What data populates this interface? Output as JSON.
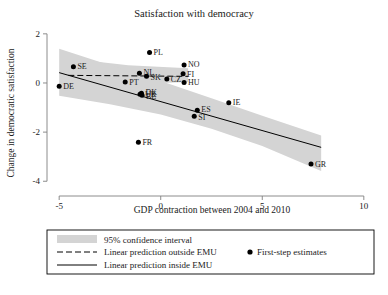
{
  "chart_data": {
    "type": "scatter",
    "title": "Satisfaction with democracy",
    "xlabel": "GDP contraction between 2004 and 2010",
    "ylabel": "Change in democratic satisfaction",
    "xlim": [
      -5.6,
      10.6
    ],
    "ylim": [
      -4.6,
      2.4
    ],
    "xticks": [
      -5,
      0,
      5,
      10
    ],
    "xtick_labels": [
      "-5",
      "0",
      "5",
      "10"
    ],
    "yticks": [
      2,
      0,
      -2,
      -4
    ],
    "ytick_labels": [
      "2",
      "0",
      "-2",
      "-4"
    ],
    "grid": false,
    "legend_position": "below-plot",
    "points": [
      {
        "label": "SE",
        "x": -4.3,
        "y": 0.66,
        "label_dx": 4,
        "label_dy": 2.6
      },
      {
        "label": "DE",
        "x": -5.0,
        "y": -0.13,
        "label_dx": 4,
        "label_dy": 2.6
      },
      {
        "label": "PT",
        "x": -1.75,
        "y": 0.04,
        "label_dx": 4,
        "label_dy": 3.2
      },
      {
        "label": "NL",
        "x": -1.05,
        "y": 0.4,
        "label_dx": 4,
        "label_dy": 1.5
      },
      {
        "label": "SK",
        "x": -0.7,
        "y": 0.27,
        "label_dx": 4,
        "label_dy": 3.4
      },
      {
        "label": "PL",
        "x": -0.55,
        "y": 1.24,
        "label_dx": 4,
        "label_dy": 2.6
      },
      {
        "label": "CZ",
        "x": 0.3,
        "y": 0.16,
        "label_dx": 4,
        "label_dy": 3.0
      },
      {
        "label": "NO",
        "x": 1.15,
        "y": 0.73,
        "label_dx": 4,
        "label_dy": 2.0
      },
      {
        "label": "FI",
        "x": 1.1,
        "y": 0.38,
        "label_dx": 4,
        "label_dy": 3.0
      },
      {
        "label": "HU",
        "x": 1.15,
        "y": 0.02,
        "label_dx": 4,
        "label_dy": 3.0
      },
      {
        "label": "DK",
        "x": -0.95,
        "y": -0.42,
        "label_dx": 4,
        "label_dy": 1.6
      },
      {
        "label": "BE",
        "x": -0.92,
        "y": -0.5,
        "label_dx": 4,
        "label_dy": 4.0
      },
      {
        "label": "UK",
        "x": -1.02,
        "y": -0.46,
        "label_dx": 5,
        "label_dy": 3.0
      },
      {
        "label": "IE",
        "x": 3.35,
        "y": -0.8,
        "label_dx": 4,
        "label_dy": 2.6
      },
      {
        "label": "ES",
        "x": 1.8,
        "y": -1.11,
        "label_dx": 4,
        "label_dy": 1.6
      },
      {
        "label": "SI",
        "x": 1.65,
        "y": -1.35,
        "label_dx": 4,
        "label_dy": 3.6
      },
      {
        "label": "FR",
        "x": -1.1,
        "y": -2.41,
        "label_dx": 4,
        "label_dy": 2.6
      },
      {
        "label": "GR",
        "x": 7.4,
        "y": -3.3,
        "label_dx": 4,
        "label_dy": 2.6
      }
    ],
    "fit_inside_emu": {
      "x0": -5.0,
      "y0": 0.42,
      "x1": 7.9,
      "y1": -2.62
    },
    "fit_outside_emu": {
      "x0": -4.55,
      "y0": 0.31,
      "x1": 1.35,
      "y1": 0.27
    },
    "ci_inside_band": {
      "upper": [
        [
          -5.0,
          1.39
        ],
        [
          -2.5,
          0.72
        ],
        [
          0.0,
          0.08
        ],
        [
          2.5,
          -0.62
        ],
        [
          5.0,
          -1.33
        ],
        [
          7.9,
          -2.14
        ]
      ],
      "lower": [
        [
          -5.0,
          -0.52
        ],
        [
          -2.5,
          -0.87
        ],
        [
          0.0,
          -1.28
        ],
        [
          2.5,
          -1.86
        ],
        [
          5.0,
          -2.57
        ],
        [
          7.9,
          -3.58
        ]
      ]
    },
    "ci_outside_band": {
      "upper": [
        [
          -4.55,
          1.0
        ],
        [
          -1.6,
          0.72
        ],
        [
          1.35,
          0.6
        ]
      ],
      "lower": [
        [
          -4.55,
          -0.46
        ],
        [
          -1.6,
          -0.05
        ],
        [
          1.35,
          0.04
        ]
      ]
    }
  },
  "legend": {
    "entries": [
      {
        "key": "ci",
        "marker": "band-swatch",
        "label": "95% confidence interval"
      },
      {
        "key": "outside",
        "marker": "dashed-line",
        "label": "Linear prediction outside EMU"
      },
      {
        "key": "inside",
        "marker": "solid-line",
        "label": "Linear prediction inside EMU"
      },
      {
        "key": "points",
        "marker": "dot",
        "label": "First-step estimates"
      }
    ]
  },
  "colors": {
    "ci_fill": "#d4d4d4",
    "line": "#000000",
    "point": "#000000",
    "axis": "#808080",
    "text": "#1a1a1a",
    "background": "#ffffff"
  }
}
